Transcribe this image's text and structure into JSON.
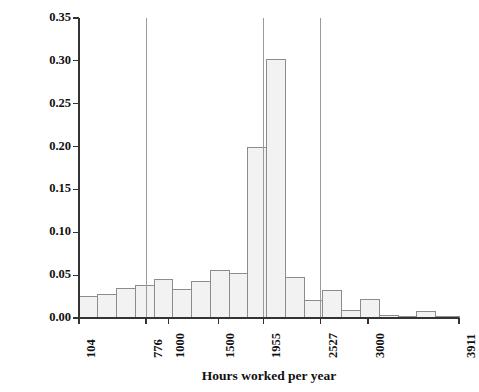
{
  "chart_data": {
    "type": "bar",
    "title": "",
    "subtitle": "",
    "xlabel": "Hours worked per year",
    "ylabel": "Fraction of individuals",
    "grid": false,
    "legend": null,
    "ylim": [
      0.0,
      0.35
    ],
    "xlim": [
      104,
      3911
    ],
    "ytick_labels": [
      "0.00",
      "0.05",
      "0.10",
      "0.15",
      "0.20",
      "0.25",
      "0.30",
      "0.35"
    ],
    "ytick_values": [
      0.0,
      0.05,
      0.1,
      0.15,
      0.2,
      0.25,
      0.3,
      0.35
    ],
    "xtick_labels": [
      "104",
      "776",
      "1000",
      "1500",
      "1955",
      "2527",
      "3000",
      "3911"
    ],
    "xtick_values": [
      104,
      776,
      1000,
      1500,
      1955,
      2527,
      3000,
      3911
    ],
    "bin_edges": [
      104,
      292,
      480,
      668,
      856,
      1044,
      1232,
      1420,
      1608,
      1796,
      1984,
      2172,
      2360,
      2548,
      2736,
      2924,
      3112,
      3300,
      3488,
      3676,
      3911
    ],
    "categories": [
      "104-292",
      "292-480",
      "480-668",
      "668-856",
      "856-1044",
      "1044-1232",
      "1232-1420",
      "1420-1608",
      "1608-1796",
      "1796-1984",
      "1984-2172",
      "2172-2360",
      "2360-2548",
      "2548-2736",
      "2736-2924",
      "2924-3112",
      "3112-3300",
      "3300-3488",
      "3488-3676",
      "3676-3911"
    ],
    "values": [
      0.025,
      0.027,
      0.035,
      0.038,
      0.045,
      0.033,
      0.043,
      0.056,
      0.052,
      0.199,
      0.302,
      0.047,
      0.021,
      0.032,
      0.009,
      0.022,
      0.003,
      0.002,
      0.008,
      0.002
    ],
    "annotations": [
      {
        "name": "reference-line-776",
        "x": 776,
        "label": "776"
      },
      {
        "name": "reference-line-1955",
        "x": 1955,
        "label": "1955"
      },
      {
        "name": "reference-line-2527",
        "x": 2527,
        "label": "2527"
      }
    ],
    "colors": {
      "bar_fill": "#f2f2f2",
      "bar_stroke": "#8c8c8c",
      "axis": "#333333",
      "reference_line": "#9a9a9a",
      "text": "#111111"
    }
  }
}
